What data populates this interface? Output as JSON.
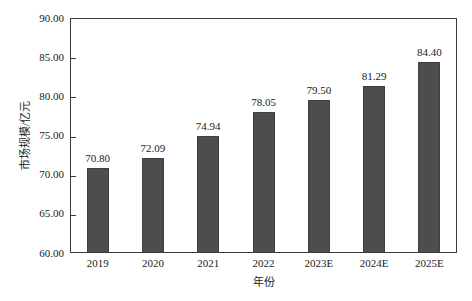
{
  "chart_data": {
    "type": "bar",
    "title": "",
    "subtitle": "",
    "xlabel": "年份",
    "ylabel": "市场规模/亿元",
    "categories": [
      "2019",
      "2020",
      "2021",
      "2022",
      "2023E",
      "2024E",
      "2025E"
    ],
    "values": [
      70.8,
      72.09,
      74.94,
      78.05,
      79.5,
      81.29,
      84.4
    ],
    "value_labels": [
      "70.80",
      "72.09",
      "74.94",
      "78.05",
      "79.50",
      "81.29",
      "84.40"
    ],
    "ylim": [
      60.0,
      90.0
    ],
    "ytick_values": [
      90.0,
      85.0,
      80.0,
      75.0,
      70.0,
      65.0,
      60.0
    ],
    "ytick_labels": [
      "90.00",
      "85.00",
      "80.00",
      "75.00",
      "70.00",
      "65.00",
      "60.00"
    ],
    "grid": false,
    "legend": false,
    "legend_position": "none",
    "series": [
      {
        "name": "市场规模/亿元",
        "values": [
          70.8,
          72.09,
          74.94,
          78.05,
          79.5,
          81.29,
          84.4
        ],
        "color": "#4d4d4d"
      }
    ],
    "colors": {
      "bar_fill": "#4d4d4d",
      "bar_edge": "#3f3f3f",
      "axis": "#3a3a3a",
      "text": "#1a1a1a",
      "background": "#ffffff"
    }
  }
}
